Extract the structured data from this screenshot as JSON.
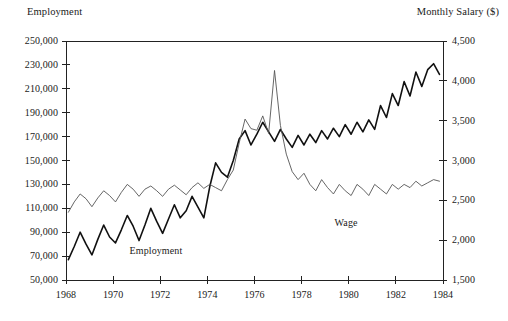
{
  "chart_data": {
    "type": "line",
    "title": "",
    "xlabel": "",
    "ylabel": "Employment",
    "y2label": "Monthly Salary ($)",
    "grid": false,
    "legend_position": "inline-annotations",
    "xlim": [
      1968.0,
      1984.0
    ],
    "ylim": [
      50000,
      250000
    ],
    "y2lim": [
      1500,
      4500
    ],
    "x_tick_labels": [
      "1968",
      "1970",
      "1972",
      "1974",
      "1976",
      "1978",
      "1980",
      "1982",
      "1984"
    ],
    "x_tick_values": [
      1968,
      1970,
      1972,
      1974,
      1976,
      1978,
      1980,
      1982,
      1984
    ],
    "y_tick_labels": [
      "250,000",
      "230,000",
      "210,000",
      "190,000",
      "170,000",
      "150,000",
      "130,000",
      "110,000",
      "90,000",
      "70,000",
      "50,000"
    ],
    "y_tick_values": [
      250000,
      230000,
      210000,
      190000,
      170000,
      150000,
      130000,
      110000,
      90000,
      70000,
      50000
    ],
    "y2_tick_labels": [
      "4,500",
      "4,000",
      "3,500",
      "3,000",
      "2,500",
      "2,000",
      "1,500"
    ],
    "y2_tick_values": [
      4500,
      4000,
      3500,
      3000,
      2500,
      2000,
      1500
    ],
    "annotations": [
      {
        "text": "Employment",
        "x": 1970.7,
        "y": 79000
      },
      {
        "text": "Wage",
        "x": 1979.4,
        "y": 103000
      }
    ],
    "series": [
      {
        "name": "Employment",
        "axis": "left",
        "unit": "persons",
        "color": "#111111",
        "line_width": 1.6,
        "x": [
          1968.1,
          1968.35,
          1968.6,
          1968.85,
          1969.1,
          1969.35,
          1969.6,
          1969.85,
          1970.1,
          1970.35,
          1970.6,
          1970.85,
          1971.1,
          1971.35,
          1971.6,
          1971.85,
          1972.1,
          1972.35,
          1972.6,
          1972.85,
          1973.1,
          1973.35,
          1973.6,
          1973.85,
          1974.1,
          1974.35,
          1974.6,
          1974.85,
          1975.1,
          1975.35,
          1975.6,
          1975.85,
          1976.1,
          1976.35,
          1976.6,
          1976.85,
          1977.1,
          1977.35,
          1977.6,
          1977.85,
          1978.1,
          1978.35,
          1978.6,
          1978.85,
          1979.1,
          1979.35,
          1979.6,
          1979.85,
          1980.1,
          1980.35,
          1980.6,
          1980.85,
          1981.1,
          1981.35,
          1981.6,
          1981.85,
          1982.1,
          1982.35,
          1982.6,
          1982.85,
          1983.1,
          1983.35,
          1983.6,
          1983.85
        ],
        "values": [
          67000,
          78000,
          90000,
          80000,
          71000,
          84000,
          96000,
          86000,
          81000,
          92000,
          104000,
          95000,
          83000,
          96000,
          110000,
          99000,
          89000,
          101000,
          113000,
          102000,
          108000,
          120000,
          111000,
          102000,
          128000,
          148000,
          140000,
          136000,
          150000,
          168000,
          175000,
          163000,
          172000,
          182000,
          174000,
          166000,
          176000,
          168000,
          161000,
          171000,
          163000,
          172000,
          165000,
          175000,
          168000,
          177000,
          170000,
          180000,
          172000,
          182000,
          174000,
          184000,
          176000,
          196000,
          186000,
          206000,
          196000,
          216000,
          204000,
          224000,
          212000,
          226000,
          231000,
          222000
        ]
      },
      {
        "name": "Wage",
        "axis": "right",
        "unit": "dollars per month",
        "color": "#555555",
        "line_width": 0.9,
        "x": [
          1968.1,
          1968.35,
          1968.6,
          1968.85,
          1969.1,
          1969.35,
          1969.6,
          1969.85,
          1970.1,
          1970.35,
          1970.6,
          1970.85,
          1971.1,
          1971.35,
          1971.6,
          1971.85,
          1972.1,
          1972.35,
          1972.6,
          1972.85,
          1973.1,
          1973.35,
          1973.6,
          1973.85,
          1974.1,
          1974.35,
          1974.6,
          1974.85,
          1975.1,
          1975.35,
          1975.6,
          1975.85,
          1976.1,
          1976.35,
          1976.6,
          1976.85,
          1977.1,
          1977.35,
          1977.6,
          1977.85,
          1978.1,
          1978.35,
          1978.6,
          1978.85,
          1979.1,
          1979.35,
          1979.6,
          1979.85,
          1980.1,
          1980.35,
          1980.6,
          1980.85,
          1981.1,
          1981.35,
          1981.6,
          1981.85,
          1982.1,
          1982.35,
          1982.6,
          1982.85,
          1983.1,
          1983.35,
          1983.6,
          1983.85
        ],
        "values": [
          2350,
          2480,
          2580,
          2520,
          2420,
          2530,
          2620,
          2560,
          2480,
          2600,
          2700,
          2640,
          2550,
          2640,
          2680,
          2620,
          2550,
          2640,
          2690,
          2630,
          2570,
          2660,
          2720,
          2650,
          2700,
          2660,
          2620,
          2760,
          2880,
          3220,
          3520,
          3400,
          3380,
          3560,
          3340,
          4130,
          3440,
          3080,
          2860,
          2760,
          2840,
          2700,
          2620,
          2760,
          2660,
          2580,
          2700,
          2620,
          2560,
          2700,
          2640,
          2560,
          2700,
          2640,
          2580,
          2700,
          2640,
          2700,
          2660,
          2740,
          2680,
          2720,
          2760,
          2740
        ]
      }
    ]
  },
  "plot_geometry": {
    "left_px": 66,
    "right_px": 443,
    "top_px": 41,
    "bottom_px": 280
  }
}
